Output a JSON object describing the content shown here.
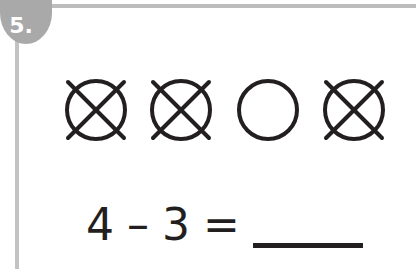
{
  "worksheet": {
    "problem_number": "5.",
    "colors": {
      "rule_gray": "#bdbdbd",
      "badge_gray": "#a9a9a9",
      "ink": "#231f20",
      "background": "#ffffff"
    },
    "counters": {
      "total": 4,
      "crossed_out": 3,
      "items": [
        {
          "index": 1,
          "shape": "circle",
          "crossed": true
        },
        {
          "index": 2,
          "shape": "circle",
          "crossed": true
        },
        {
          "index": 3,
          "shape": "circle",
          "crossed": false
        },
        {
          "index": 4,
          "shape": "circle",
          "crossed": true
        }
      ]
    },
    "equation": {
      "minuend": "4",
      "operator": "–",
      "subtrahend": "3",
      "equals": "=",
      "answer": ""
    }
  }
}
